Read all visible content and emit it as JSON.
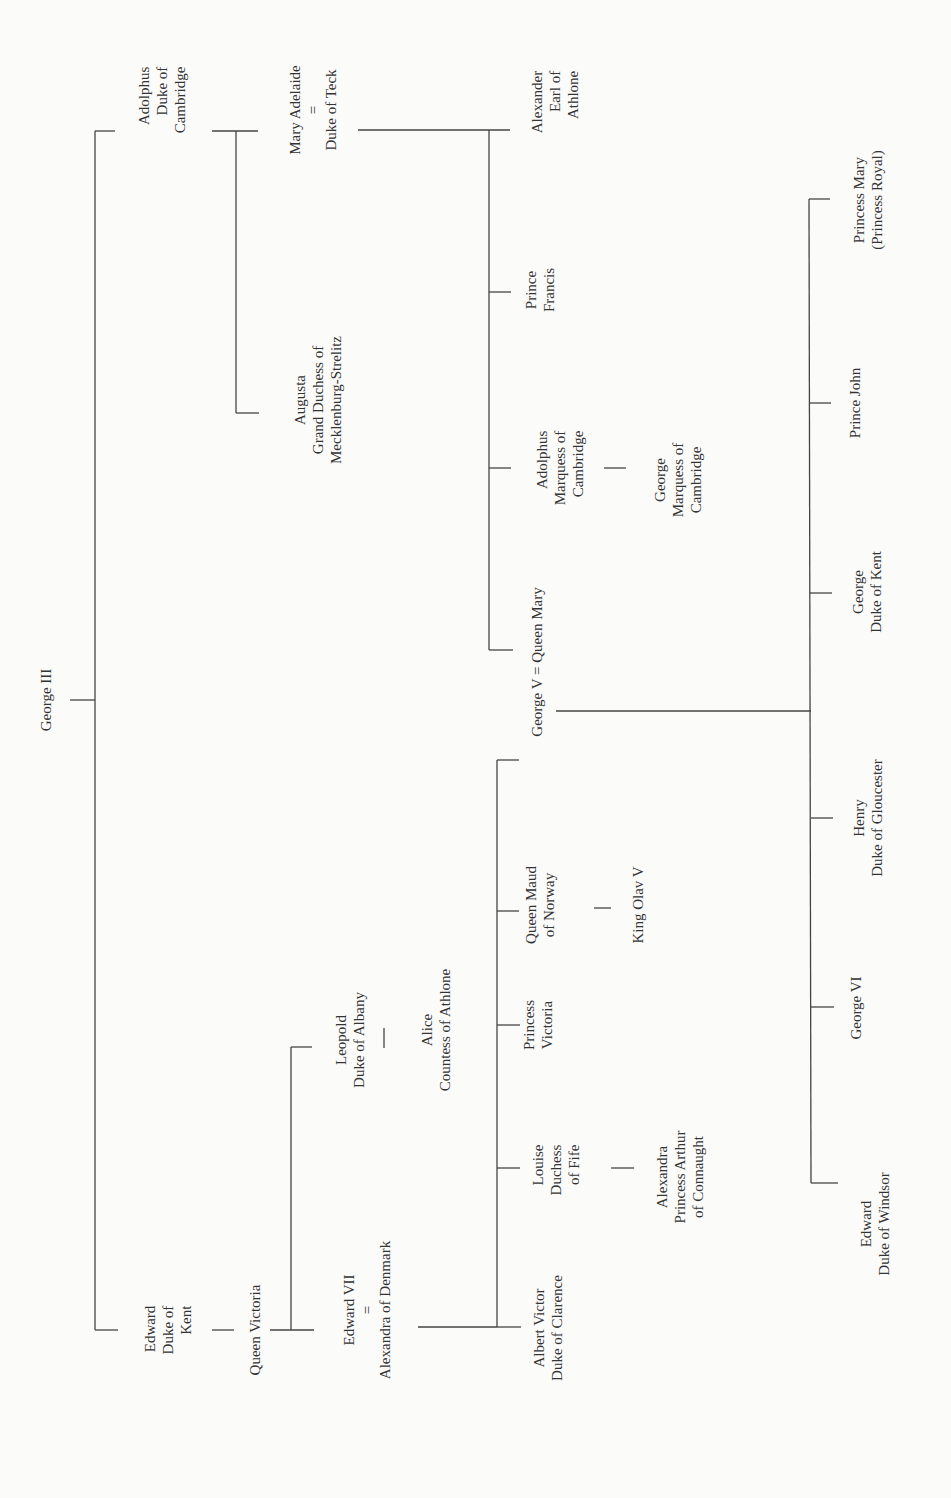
{
  "colors": {
    "line": "#444444",
    "text": "#333333",
    "background": "#fbfbfa"
  },
  "nodes": [
    {
      "id": "george-iii",
      "lines": [
        "George III"
      ],
      "x": 46,
      "y": 700
    },
    {
      "id": "adolphus-duke-of-cambridge",
      "lines": [
        "Adolphus",
        "Duke of",
        "Cambridge"
      ],
      "x": 162,
      "y": 100,
      "align": "right"
    },
    {
      "id": "edward-duke-of-kent",
      "lines": [
        "Edward",
        "Duke of",
        "Kent"
      ],
      "x": 168,
      "y": 1330,
      "align": "right"
    },
    {
      "id": "mary-adelaide-duke-of-teck",
      "lines": [
        "Mary Adelaide",
        "=",
        "Duke of Teck"
      ],
      "x": 313,
      "y": 110
    },
    {
      "id": "augusta-grand-duchess",
      "lines": [
        "Augusta",
        "Grand Duchess of",
        "Mecklenburg-Strelitz"
      ],
      "x": 318,
      "y": 400
    },
    {
      "id": "queen-victoria",
      "lines": [
        "Queen Victoria"
      ],
      "x": 255,
      "y": 1330
    },
    {
      "id": "leopold-duke-of-albany",
      "lines": [
        "Leopold",
        "Duke of Albany"
      ],
      "x": 350,
      "y": 1040
    },
    {
      "id": "alice-countess-of-athlone",
      "lines": [
        "Alice",
        "Countess of Athlone"
      ],
      "x": 436,
      "y": 1030
    },
    {
      "id": "edward-vii-alexandra",
      "lines": [
        "Edward VII",
        "=",
        "Alexandra of Denmark"
      ],
      "x": 367,
      "y": 1310
    },
    {
      "id": "alexander-earl-of-athlone",
      "lines": [
        "Alexander",
        "Earl of",
        "Athlone"
      ],
      "x": 555,
      "y": 102,
      "align": "right"
    },
    {
      "id": "prince-francis",
      "lines": [
        "Prince",
        "Francis"
      ],
      "x": 540,
      "y": 290
    },
    {
      "id": "adolphus-marquess-of-cambridge",
      "lines": [
        "Adolphus",
        "Marquess of",
        "Cambridge"
      ],
      "x": 560,
      "y": 468,
      "align": "right"
    },
    {
      "id": "george-marquess-of-cambridge",
      "lines": [
        "George",
        "Marquess of",
        "Cambridge"
      ],
      "x": 678,
      "y": 480
    },
    {
      "id": "george-v-queen-mary",
      "lines": [
        "George V = Queen Mary"
      ],
      "x": 537,
      "y": 662
    },
    {
      "id": "queen-maud-of-norway",
      "lines": [
        "Queen Maud",
        "of Norway"
      ],
      "x": 540,
      "y": 905
    },
    {
      "id": "king-olav-v",
      "lines": [
        "King Olav V"
      ],
      "x": 638,
      "y": 905
    },
    {
      "id": "princess-victoria",
      "lines": [
        "Princess",
        "Victoria"
      ],
      "x": 538,
      "y": 1025
    },
    {
      "id": "louise-duchess-of-fife",
      "lines": [
        "Louise",
        "Duchess",
        "of Fife"
      ],
      "x": 556,
      "y": 1170,
      "align": "right"
    },
    {
      "id": "alexandra-princess-arthur",
      "lines": [
        "Alexandra",
        "Princess Arthur",
        "of Connaught"
      ],
      "x": 680,
      "y": 1177
    },
    {
      "id": "albert-victor-duke-of-clarence",
      "lines": [
        "Albert Victor",
        "Duke of Clarence"
      ],
      "x": 548,
      "y": 1328
    },
    {
      "id": "princess-mary-princess-royal",
      "lines": [
        "Princess Mary",
        "(Princess Royal)"
      ],
      "x": 868,
      "y": 200
    },
    {
      "id": "prince-john",
      "lines": [
        "Prince John"
      ],
      "x": 855,
      "y": 403
    },
    {
      "id": "george-duke-of-kent",
      "lines": [
        "George",
        "Duke of Kent"
      ],
      "x": 867,
      "y": 592
    },
    {
      "id": "henry-duke-of-gloucester",
      "lines": [
        "Henry",
        "Duke of Gloucester"
      ],
      "x": 868,
      "y": 818
    },
    {
      "id": "george-vi",
      "lines": [
        "George VI"
      ],
      "x": 856,
      "y": 1008
    },
    {
      "id": "edward-duke-of-windsor",
      "lines": [
        "Edward",
        "Duke of Windsor"
      ],
      "x": 875,
      "y": 1224
    }
  ],
  "lines": [
    [
      70,
      700,
      95,
      700
    ],
    [
      95,
      131,
      95,
      1330
    ],
    [
      95,
      131,
      115,
      131
    ],
    [
      95,
      1330,
      118,
      1330
    ],
    [
      212,
      131,
      258,
      131
    ],
    [
      236,
      131,
      236,
      413
    ],
    [
      236,
      413,
      259,
      413
    ],
    [
      212,
      1330,
      234,
      1330
    ],
    [
      270,
      1330,
      314,
      1330
    ],
    [
      291,
      1047,
      291,
      1330
    ],
    [
      291,
      1047,
      312,
      1047
    ],
    [
      384,
      1028,
      384,
      1048
    ],
    [
      358,
      130,
      510,
      130
    ],
    [
      489,
      130,
      489,
      650
    ],
    [
      489,
      292,
      511,
      292
    ],
    [
      489,
      468,
      511,
      468
    ],
    [
      489,
      650,
      513,
      650
    ],
    [
      604,
      468,
      626,
      468
    ],
    [
      418,
      1327,
      497,
      1327
    ],
    [
      497,
      760,
      497,
      1327
    ],
    [
      497,
      760,
      519,
      760
    ],
    [
      497,
      911,
      519,
      911
    ],
    [
      497,
      1025,
      520,
      1025
    ],
    [
      497,
      1168,
      520,
      1168
    ],
    [
      497,
      1327,
      521,
      1327
    ],
    [
      594,
      908,
      611,
      908
    ],
    [
      611,
      1168,
      634,
      1168
    ],
    [
      556,
      711,
      811,
      711
    ],
    [
      809,
      199,
      811,
      1183
    ],
    [
      809,
      199,
      830,
      199
    ],
    [
      810,
      403,
      831,
      403
    ],
    [
      810,
      593,
      832,
      593
    ],
    [
      811,
      818,
      833,
      818
    ],
    [
      811,
      1007,
      834,
      1007
    ],
    [
      811,
      1183,
      838,
      1183
    ]
  ]
}
